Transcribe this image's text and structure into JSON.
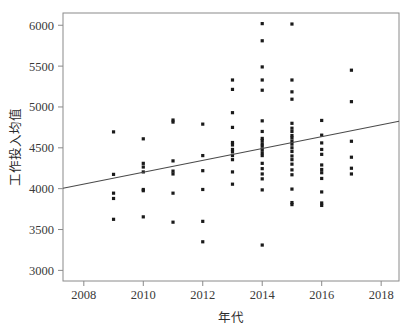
{
  "chart_data": {
    "type": "scatter",
    "title": "",
    "xlabel": "年代",
    "ylabel": "工作投入均值",
    "xlim": [
      2007.3,
      2018.6
    ],
    "ylim": [
      2870,
      6150
    ],
    "xticks": [
      2008,
      2010,
      2012,
      2014,
      2016,
      2018
    ],
    "xtick_labels": [
      "2008",
      "2010",
      "2012",
      "2014",
      "2016",
      "2018"
    ],
    "yticks": [
      3000,
      3500,
      4000,
      4500,
      5000,
      5500,
      6000
    ],
    "ytick_labels": [
      "3000",
      "3500",
      "4000",
      "4500",
      "5000",
      "5500",
      "6000"
    ],
    "grid": false,
    "legend": null,
    "marker_color": "#1a1a1a",
    "marker_size": 1.6,
    "trendline": {
      "type": "linear",
      "color": "#4a4a4a",
      "x_start": 2007.3,
      "y_start": 4005,
      "x_end": 2018.6,
      "y_end": 4825
    },
    "points": [
      [
        2009,
        4695
      ],
      [
        2009,
        4175
      ],
      [
        2009,
        3945
      ],
      [
        2009,
        3880
      ],
      [
        2009,
        3625
      ],
      [
        2010,
        4610
      ],
      [
        2010,
        4310
      ],
      [
        2010,
        4265
      ],
      [
        2010,
        4205
      ],
      [
        2010,
        3990
      ],
      [
        2010,
        3975
      ],
      [
        2010,
        3655
      ],
      [
        2011,
        4840
      ],
      [
        2011,
        4815
      ],
      [
        2011,
        4340
      ],
      [
        2011,
        4215
      ],
      [
        2011,
        4180
      ],
      [
        2011,
        3945
      ],
      [
        2011,
        3590
      ],
      [
        2012,
        4790
      ],
      [
        2012,
        4405
      ],
      [
        2012,
        4220
      ],
      [
        2012,
        3990
      ],
      [
        2012,
        3600
      ],
      [
        2012,
        3350
      ],
      [
        2013,
        5330
      ],
      [
        2013,
        5215
      ],
      [
        2013,
        4930
      ],
      [
        2013,
        4750
      ],
      [
        2013,
        4565
      ],
      [
        2013,
        4535
      ],
      [
        2013,
        4480
      ],
      [
        2013,
        4450
      ],
      [
        2013,
        4405
      ],
      [
        2013,
        4355
      ],
      [
        2013,
        4205
      ],
      [
        2013,
        4055
      ],
      [
        2014,
        6020
      ],
      [
        2014,
        5810
      ],
      [
        2014,
        5490
      ],
      [
        2014,
        5330
      ],
      [
        2014,
        5205
      ],
      [
        2014,
        4830
      ],
      [
        2014,
        4700
      ],
      [
        2014,
        4615
      ],
      [
        2014,
        4590
      ],
      [
        2014,
        4550
      ],
      [
        2014,
        4520
      ],
      [
        2014,
        4480
      ],
      [
        2014,
        4440
      ],
      [
        2014,
        4405
      ],
      [
        2014,
        4310
      ],
      [
        2014,
        4245
      ],
      [
        2014,
        4180
      ],
      [
        2014,
        4120
      ],
      [
        2014,
        3985
      ],
      [
        2014,
        3310
      ],
      [
        2015,
        6015
      ],
      [
        2015,
        5330
      ],
      [
        2015,
        5185
      ],
      [
        2015,
        5095
      ],
      [
        2015,
        4800
      ],
      [
        2015,
        4740
      ],
      [
        2015,
        4700
      ],
      [
        2015,
        4650
      ],
      [
        2015,
        4620
      ],
      [
        2015,
        4580
      ],
      [
        2015,
        4545
      ],
      [
        2015,
        4500
      ],
      [
        2015,
        4455
      ],
      [
        2015,
        4400
      ],
      [
        2015,
        4355
      ],
      [
        2015,
        4300
      ],
      [
        2015,
        4230
      ],
      [
        2015,
        4170
      ],
      [
        2015,
        3995
      ],
      [
        2015,
        3830
      ],
      [
        2015,
        3805
      ],
      [
        2016,
        4835
      ],
      [
        2016,
        4655
      ],
      [
        2016,
        4560
      ],
      [
        2016,
        4480
      ],
      [
        2016,
        4420
      ],
      [
        2016,
        4290
      ],
      [
        2016,
        4235
      ],
      [
        2016,
        4195
      ],
      [
        2016,
        4125
      ],
      [
        2016,
        3960
      ],
      [
        2016,
        3825
      ],
      [
        2016,
        3795
      ],
      [
        2017,
        5450
      ],
      [
        2017,
        5065
      ],
      [
        2017,
        4580
      ],
      [
        2017,
        4385
      ],
      [
        2017,
        4250
      ],
      [
        2017,
        4180
      ]
    ]
  },
  "axes": {
    "frame": {
      "left": 63,
      "top": 13,
      "right": 399,
      "bottom": 281
    }
  }
}
